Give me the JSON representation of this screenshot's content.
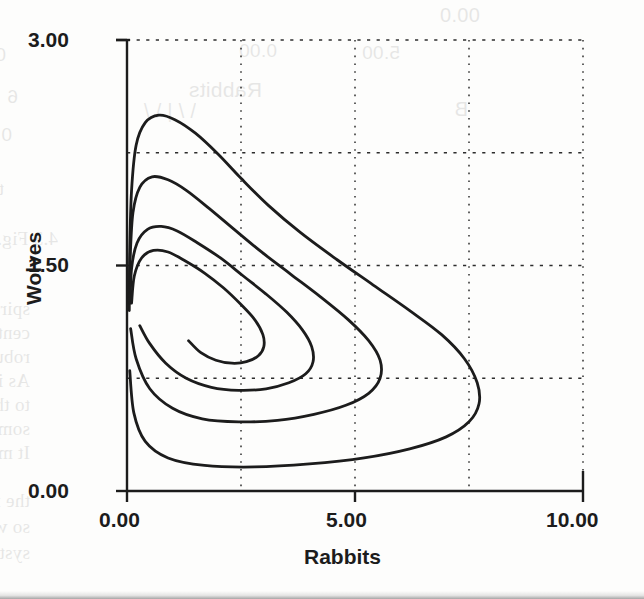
{
  "page": {
    "background_color": "#fdfdfc",
    "ink_color": "#1c1c1c"
  },
  "ghost_text": {
    "note": "faint show-through text from the facing/underlying scanned book page",
    "lines": [
      {
        "text": "0.00",
        "x": 440,
        "y": 4,
        "size": 20,
        "mirror": false,
        "sans": true
      },
      {
        "text": "0.00",
        "x": 277,
        "y": 40,
        "size": 19,
        "mirror": true,
        "sans": true
      },
      {
        "text": "0.00",
        "x": 6,
        "y": 44,
        "size": 19,
        "mirror": true,
        "sans": true
      },
      {
        "text": "5.00",
        "x": 400,
        "y": 42,
        "size": 19,
        "mirror": true,
        "sans": true
      },
      {
        "text": "Rabbits",
        "x": 262,
        "y": 78,
        "size": 21,
        "mirror": true,
        "sans": true
      },
      {
        "text": "6",
        "x": 18,
        "y": 86,
        "size": 19,
        "mirror": true,
        "sans": true
      },
      {
        "text": "B",
        "x": 468,
        "y": 98,
        "size": 20,
        "mirror": true,
        "sans": true
      },
      {
        "text": "\\  /   |    \\   /",
        "x": 196,
        "y": 100,
        "size": 20,
        "mirror": true,
        "sans": true
      },
      {
        "text": "0.0",
        "x": 12,
        "y": 124,
        "size": 19,
        "mirror": true,
        "sans": true
      },
      {
        "text": "the wolves all stay and prosper with this Volterra model as arrive a",
        "x": 4,
        "y": 178,
        "size": 19,
        "mirror": true,
        "sans": false
      },
      {
        "text": "4.3 Fig. 4.1.4     Fixed point in the Volterra model.",
        "x": 58,
        "y": 228,
        "size": 19,
        "mirror": true,
        "sans": false
      },
      {
        "text": "spiral in the first quadrant as the system converges upon som",
        "x": 30,
        "y": 298,
        "size": 19,
        "mirror": true,
        "sans": false
      },
      {
        "text": "central point needs to be unique, this is another illustrati",
        "x": 30,
        "y": 322,
        "size": 19,
        "mirror": true,
        "sans": false
      },
      {
        "text": "robustness of these population dynamics models of the na",
        "x": 30,
        "y": 346,
        "size": 19,
        "mirror": true,
        "sans": false
      },
      {
        "text": "As is usual it is well that the given numerical values",
        "x": 30,
        "y": 370,
        "size": 19,
        "mirror": true,
        "sans": false
      },
      {
        "text": "to the selected beginning values; another, smaller initial",
        "x": 30,
        "y": 394,
        "size": 19,
        "mirror": true,
        "sans": false
      },
      {
        "text": "something quantitatively different reality, and would not even",
        "x": 30,
        "y": 418,
        "size": 19,
        "mirror": true,
        "sans": false
      },
      {
        "text": "It may even happen we learn this time.",
        "x": 30,
        "y": 442,
        "size": 19,
        "mirror": true,
        "sans": false
      },
      {
        "text": "the major point that emerges. The Volterra model is the",
        "x": 30,
        "y": 490,
        "size": 19,
        "mirror": true,
        "sans": false
      },
      {
        "text": "so well in itself and it is regulated by some internal",
        "x": 30,
        "y": 516,
        "size": 19,
        "mirror": true,
        "sans": false
      },
      {
        "text": "system. The parameters are two from actual population",
        "x": 30,
        "y": 542,
        "size": 19,
        "mirror": true,
        "sans": false
      }
    ]
  },
  "axes": {
    "y_label": "Wolves",
    "x_label": "Rabbits",
    "y_ticks": [
      {
        "value": 3.0,
        "label": "3.00"
      },
      {
        "value": 1.5,
        "label": "1.50"
      },
      {
        "value": 0.0,
        "label": "0.00"
      }
    ],
    "x_ticks": [
      {
        "value": 0.0,
        "label": "0.00"
      },
      {
        "value": 5.0,
        "label": "5.00"
      },
      {
        "value": 10.0,
        "label": "10.00"
      }
    ],
    "y_range": [
      0.0,
      3.0
    ],
    "x_range": [
      0.0,
      10.0
    ],
    "grid": "dotted",
    "line_color": "#1c1c1c"
  },
  "chart_data": {
    "type": "line",
    "title": "",
    "subtitle": "",
    "xlabel": "Rabbits",
    "ylabel": "Wolves",
    "xlim": [
      0.0,
      10.0
    ],
    "ylim": [
      0.0,
      3.0
    ],
    "xticks": [
      0.0,
      5.0,
      10.0
    ],
    "yticks": [
      0.0,
      1.5,
      3.0
    ],
    "grid": true,
    "grid_style": "dotted",
    "grid_x": [
      0.0,
      2.5,
      5.0,
      7.5,
      10.0
    ],
    "grid_y": [
      0.0,
      0.75,
      1.5,
      2.25,
      3.0
    ],
    "legend": null,
    "annotations": [],
    "series": [
      {
        "name": "orbit-1-outermost",
        "points": [
          [
            0.05,
            1.2
          ],
          [
            0.06,
            1.6
          ],
          [
            0.1,
            2.0
          ],
          [
            0.2,
            2.3
          ],
          [
            0.4,
            2.45
          ],
          [
            0.7,
            2.5
          ],
          [
            1.05,
            2.47
          ],
          [
            1.5,
            2.38
          ],
          [
            2.0,
            2.24
          ],
          [
            2.5,
            2.08
          ],
          [
            3.1,
            1.9
          ],
          [
            3.8,
            1.72
          ],
          [
            4.6,
            1.54
          ],
          [
            5.4,
            1.37
          ],
          [
            6.2,
            1.2
          ],
          [
            6.9,
            1.04
          ],
          [
            7.4,
            0.88
          ],
          [
            7.68,
            0.72
          ],
          [
            7.72,
            0.58
          ],
          [
            7.5,
            0.46
          ],
          [
            7.0,
            0.36
          ],
          [
            6.2,
            0.28
          ],
          [
            5.2,
            0.22
          ],
          [
            4.0,
            0.18
          ],
          [
            2.8,
            0.16
          ],
          [
            1.7,
            0.17
          ],
          [
            0.9,
            0.22
          ],
          [
            0.4,
            0.33
          ],
          [
            0.15,
            0.52
          ],
          [
            0.06,
            0.8
          ]
        ]
      },
      {
        "name": "orbit-2",
        "points": [
          [
            0.05,
            1.25
          ],
          [
            0.07,
            1.55
          ],
          [
            0.13,
            1.85
          ],
          [
            0.28,
            2.02
          ],
          [
            0.55,
            2.09
          ],
          [
            0.9,
            2.07
          ],
          [
            1.3,
            2.0
          ],
          [
            1.8,
            1.88
          ],
          [
            2.35,
            1.74
          ],
          [
            2.95,
            1.59
          ],
          [
            3.6,
            1.44
          ],
          [
            4.25,
            1.29
          ],
          [
            4.85,
            1.14
          ],
          [
            5.3,
            1.0
          ],
          [
            5.55,
            0.87
          ],
          [
            5.55,
            0.75
          ],
          [
            5.3,
            0.65
          ],
          [
            4.8,
            0.57
          ],
          [
            4.1,
            0.51
          ],
          [
            3.3,
            0.47
          ],
          [
            2.45,
            0.46
          ],
          [
            1.65,
            0.48
          ],
          [
            1.0,
            0.55
          ],
          [
            0.5,
            0.68
          ],
          [
            0.2,
            0.88
          ],
          [
            0.08,
            1.08
          ]
        ]
      },
      {
        "name": "orbit-3",
        "points": [
          [
            0.07,
            1.25
          ],
          [
            0.1,
            1.48
          ],
          [
            0.22,
            1.65
          ],
          [
            0.45,
            1.74
          ],
          [
            0.75,
            1.76
          ],
          [
            1.1,
            1.73
          ],
          [
            1.55,
            1.65
          ],
          [
            2.05,
            1.55
          ],
          [
            2.55,
            1.43
          ],
          [
            3.05,
            1.31
          ],
          [
            3.5,
            1.19
          ],
          [
            3.85,
            1.07
          ],
          [
            4.05,
            0.96
          ],
          [
            4.08,
            0.86
          ],
          [
            3.92,
            0.78
          ],
          [
            3.55,
            0.72
          ],
          [
            3.05,
            0.68
          ],
          [
            2.45,
            0.67
          ],
          [
            1.85,
            0.69
          ],
          [
            1.3,
            0.75
          ],
          [
            0.85,
            0.85
          ],
          [
            0.5,
            0.98
          ],
          [
            0.28,
            1.1
          ]
        ]
      },
      {
        "name": "orbit-4-innermost",
        "points": [
          [
            0.1,
            1.25
          ],
          [
            0.16,
            1.43
          ],
          [
            0.32,
            1.55
          ],
          [
            0.58,
            1.6
          ],
          [
            0.9,
            1.59
          ],
          [
            1.28,
            1.53
          ],
          [
            1.7,
            1.45
          ],
          [
            2.12,
            1.35
          ],
          [
            2.5,
            1.24
          ],
          [
            2.8,
            1.14
          ],
          [
            2.98,
            1.04
          ],
          [
            3.0,
            0.96
          ],
          [
            2.88,
            0.9
          ],
          [
            2.62,
            0.86
          ],
          [
            2.3,
            0.85
          ],
          [
            1.95,
            0.87
          ],
          [
            1.62,
            0.92
          ],
          [
            1.35,
            1.0
          ]
        ]
      }
    ]
  }
}
